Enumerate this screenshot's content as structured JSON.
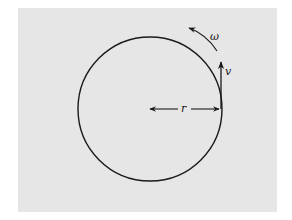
{
  "figure": {
    "background_color": "#e6e6e6",
    "page_color": "#ffffff",
    "stroke_color": "#1a1a1a"
  },
  "labels": {
    "angular_velocity": "ω",
    "velocity": "v",
    "radius": "r"
  },
  "circle": {
    "cx": 150,
    "cy": 109,
    "r": 72
  },
  "icons": {
    "omega_arrow": "curved-arrow-counterclockwise",
    "velocity_arrow": "arrow-up",
    "radius_arrow": "double-headed-arrow-horizontal"
  }
}
